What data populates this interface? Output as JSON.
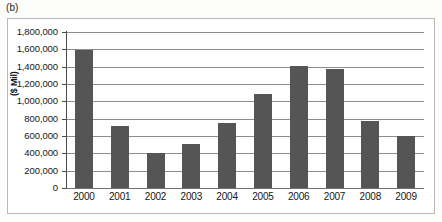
{
  "panel": {
    "label": "(b)"
  },
  "chart_data": {
    "type": "bar",
    "title": "",
    "xlabel": "",
    "ylabel": "($ Mil)",
    "categories": [
      "2000",
      "2001",
      "2002",
      "2003",
      "2004",
      "2005",
      "2006",
      "2007",
      "2008",
      "2009"
    ],
    "values": [
      1590000,
      710000,
      405000,
      510000,
      755000,
      1090000,
      1405000,
      1370000,
      770000,
      605000
    ],
    "ylim": [
      0,
      1800000
    ],
    "ytick_values": [
      1800000,
      1600000,
      1400000,
      1200000,
      1000000,
      800000,
      600000,
      400000,
      200000,
      0
    ],
    "ytick_labels": [
      "1,800,000",
      "1,600,000",
      "1,400,000",
      "1,200,000",
      "1,000,000",
      "800,000",
      "600,000",
      "400,000",
      "200,000",
      "0"
    ],
    "grid": true,
    "legend": false,
    "series": [
      {
        "name": "",
        "color": "#555555",
        "values": [
          1590000,
          710000,
          405000,
          510000,
          755000,
          1090000,
          1405000,
          1370000,
          770000,
          605000
        ]
      }
    ]
  },
  "colors": {
    "bar": "#555555",
    "gridline": "#8d8d8d",
    "axis": "#4a4a4a",
    "frame": "#b9b9b9",
    "background": "#ffffff"
  }
}
